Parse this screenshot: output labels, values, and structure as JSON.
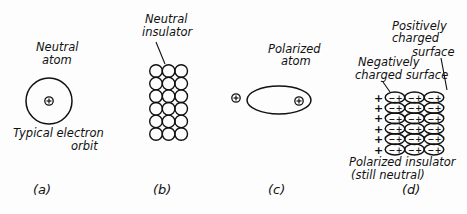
{
  "panels": [
    {
      "id": "a",
      "caption": "(a)",
      "title_line1": "Neutral",
      "title_line2": "atom",
      "note_line1": "Typical electron",
      "note_line2": "orbit",
      "nucleus_symbol": "+"
    },
    {
      "id": "b",
      "caption": "(b)",
      "title_line1": "Neutral",
      "title_line2": "insulator",
      "grid": {
        "rows": 6,
        "cols": 3
      }
    },
    {
      "id": "c",
      "caption": "(c)",
      "title_line1": "Polarized",
      "title_line2": "atom",
      "external_charge_symbol": "+",
      "nucleus_symbol": "+"
    },
    {
      "id": "d",
      "caption": "(d)",
      "pos_label_line1": "Positively",
      "pos_label_line2": "charged",
      "pos_label_line3": "surface",
      "neg_label_line1": "Negatively",
      "neg_label_line2": "charged surface",
      "bottom_line1": "Polarized insulator",
      "bottom_line2": "(still neutral)",
      "grid": {
        "rows": 6,
        "cols": 3
      },
      "external_charge_symbol": "+",
      "dipole_neg": "−",
      "dipole_pos": "+"
    }
  ]
}
